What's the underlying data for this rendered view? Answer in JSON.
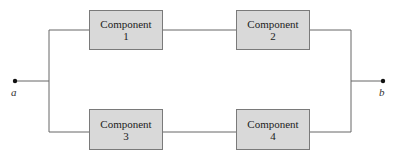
{
  "diagram": {
    "type": "parallel-series reliability block diagram",
    "terminals": [
      {
        "id": "a",
        "label": "a"
      },
      {
        "id": "b",
        "label": "b"
      }
    ],
    "components": [
      {
        "name": "Component",
        "number": "1",
        "branch": "top"
      },
      {
        "name": "Component",
        "number": "2",
        "branch": "top"
      },
      {
        "name": "Component",
        "number": "3",
        "branch": "bottom"
      },
      {
        "name": "Component",
        "number": "4",
        "branch": "bottom"
      }
    ],
    "colors": {
      "box_fill": "#d9d9d9",
      "box_border": "#7a7a7a",
      "wire": "#666666",
      "terminal": "#111111"
    }
  }
}
